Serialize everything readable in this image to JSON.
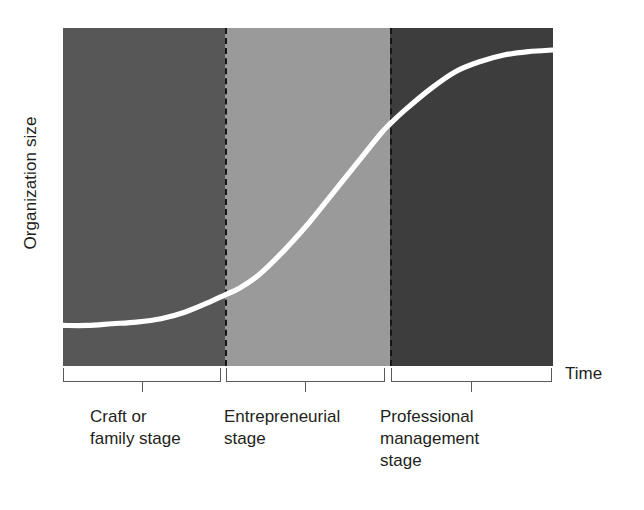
{
  "chart_data": {
    "type": "line",
    "title": "",
    "subtitle": "",
    "xlabel": "Time",
    "ylabel": "Organization size",
    "grid": false,
    "legend_position": "none",
    "xlim": [
      0,
      100
    ],
    "ylim": [
      0,
      100
    ],
    "x_tick_labels": [],
    "y_tick_labels": [],
    "series": [
      {
        "name": "Organization size over time",
        "style": "s-curve",
        "color": "#ffffff",
        "x": [
          0,
          5,
          10,
          15,
          20,
          25,
          30,
          33,
          36,
          40,
          45,
          50,
          55,
          60,
          65,
          67,
          70,
          75,
          80,
          85,
          90,
          95,
          100
        ],
        "y": [
          12,
          12,
          12.5,
          13,
          14,
          16,
          19,
          21,
          23,
          27,
          34,
          42,
          51,
          60,
          69,
          72,
          76,
          82,
          87,
          90,
          92,
          93,
          93.5
        ]
      }
    ],
    "bands": [
      {
        "name": "Craft or family stage",
        "label": "Craft or\nfamily stage",
        "x_start": 0,
        "x_end": 33,
        "color": "#575757"
      },
      {
        "name": "Entrepreneurial stage",
        "label": "Entrepreneurial\nstage",
        "x_start": 33,
        "x_end": 67,
        "color": "#9a9a9a"
      },
      {
        "name": "Professional management stage",
        "label": "Professional\nmanagement\nstage",
        "x_start": 67,
        "x_end": 100,
        "color": "#3d3d3d"
      }
    ],
    "annotations": [
      {
        "name": "divider-1",
        "x": 33,
        "style": "dashed",
        "color": "#15161a"
      },
      {
        "name": "divider-2",
        "x": 67,
        "style": "dashed",
        "color": "#15161a"
      }
    ],
    "colors": {
      "curve": "#ffffff",
      "band_craft": "#575757",
      "band_entrepreneurial": "#9a9a9a",
      "band_professional": "#3d3d3d",
      "divider": "#15161a",
      "bracket": "#58595b",
      "text": "#231f20",
      "background": "#ffffff"
    }
  },
  "axes": {
    "y_label": "Organization size",
    "x_label": "Time"
  },
  "stages": [
    {
      "label": "Craft or\nfamily stage",
      "short": "craft-or-family-stage"
    },
    {
      "label": "Entrepreneurial\nstage",
      "short": "entrepreneurial-stage"
    },
    {
      "label": "Professional\nmanagement\nstage",
      "short": "professional-management-stage"
    }
  ]
}
